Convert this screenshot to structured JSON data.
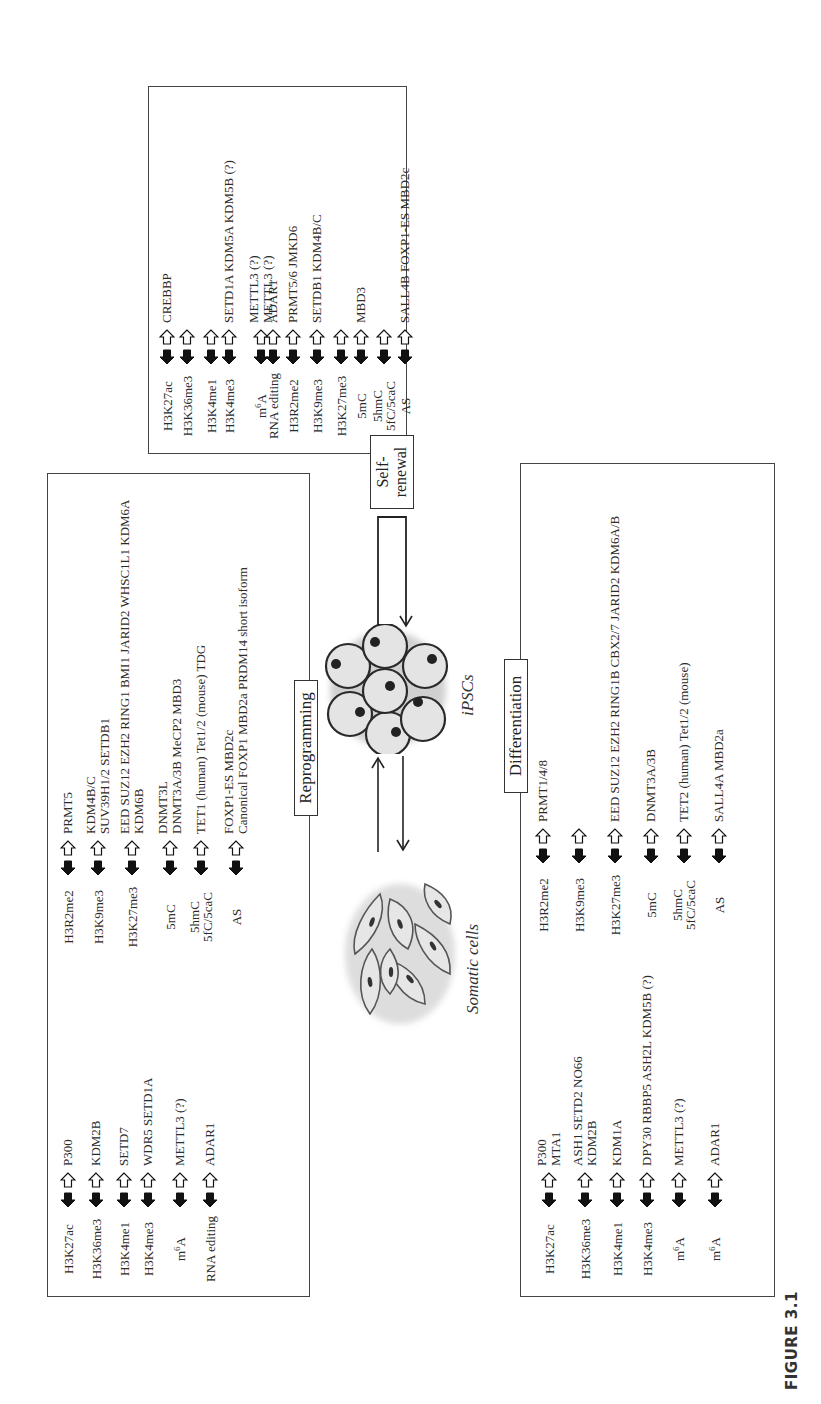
{
  "figure": {
    "label": "FIGURE 3.1",
    "orientation": "rotated 90 degrees counter-clockwise"
  },
  "cells": {
    "somatic_label": "Somatic cells",
    "ipsc_label": "iPSCs"
  },
  "panels": {
    "reprogramming": {
      "title": "Reprogramming",
      "rows": [
        {
          "mark": "H3K27ac",
          "genes": [
            "P300"
          ]
        },
        {
          "mark": "H3K36me3",
          "genes": [
            "KDM2B"
          ]
        },
        {
          "mark": "H3K4me1",
          "genes": [
            "SETD7"
          ]
        },
        {
          "mark": "H3K4me3",
          "genes": [
            "WDR5 SETD1A"
          ]
        },
        {
          "mark": "m6A",
          "genes": [
            "METTL3 (?)"
          ]
        },
        {
          "mark": "RNA editing",
          "genes": [
            "ADAR1"
          ]
        },
        {
          "mark": "H3R2me2",
          "genes": [
            "PRMT5"
          ]
        },
        {
          "mark": "H3K9me3",
          "genes": [
            "KDM4B/C",
            "SUV39H1/2 SETDB1"
          ]
        },
        {
          "mark": "H3K27me3",
          "genes": [
            "EED SUZ12 EZH2 RING1 BMI1 JARID2 WHSC1L1 KDM6A",
            "KDM6B"
          ]
        },
        {
          "mark": "5mC",
          "genes": [
            "DNMT3L",
            "DNMT3A/3B MeCP2 MBD3"
          ]
        },
        {
          "mark": "5hmC 5fC/5caC",
          "genes": [
            "TET1 (human) Tet1/2 (mouse) TDG"
          ]
        },
        {
          "mark": "AS",
          "genes": [
            "FOXP1-ES MBD2c",
            "Canonical FOXP1 MBD2a PRDM14 short isoform"
          ]
        }
      ]
    },
    "self_renewal": {
      "title": "Self-renewal",
      "rows": [
        {
          "mark": "H3K27ac",
          "genes": [
            "CREBBP"
          ]
        },
        {
          "mark": "H3K36me3",
          "genes": [
            ""
          ]
        },
        {
          "mark": "H3K4me1",
          "genes": [
            ""
          ]
        },
        {
          "mark": "H3K4me3",
          "genes": [
            "SETD1A KDM5A KDM5B (?)"
          ]
        },
        {
          "mark": "m6A",
          "genes": [
            "METTL3 (?)",
            "METTL3 (?)"
          ]
        },
        {
          "mark": "RNA editing",
          "genes": [
            "ADAR1"
          ]
        },
        {
          "mark": "H3R2me2",
          "genes": [
            "PRMT5/6 JMKD6"
          ]
        },
        {
          "mark": "H3K9me3",
          "genes": [
            "SETDB1 KDM4B/C"
          ]
        },
        {
          "mark": "H3K27me3",
          "genes": [
            ""
          ]
        },
        {
          "mark": "5mC",
          "genes": [
            "MBD3"
          ]
        },
        {
          "mark": "5hmC 5fC/5caC",
          "genes": [
            ""
          ]
        },
        {
          "mark": "AS",
          "genes": [
            "SALL4B FOXP1-ES MBD2c"
          ]
        }
      ]
    },
    "differentiation": {
      "title": "Differentiation",
      "rows": [
        {
          "mark": "H3K27ac",
          "genes": [
            "P300",
            "MTA1"
          ]
        },
        {
          "mark": "H3K36me3",
          "genes": [
            "ASH1 SETD2 NO66",
            "KDM2B"
          ]
        },
        {
          "mark": "H3K4me1",
          "genes": [
            "KDM1A"
          ]
        },
        {
          "mark": "H3K4me3",
          "genes": [
            "DPY30 RBBP5 ASH2L KDM5B (?)"
          ]
        },
        {
          "mark": "m6A",
          "genes": [
            "METTL3 (?)"
          ]
        },
        {
          "mark": "m6A",
          "genes": [
            "ADAR1"
          ]
        },
        {
          "mark": "H3R2me2",
          "genes": [
            "PRMT1/4/8"
          ]
        },
        {
          "mark": "H3K9me3",
          "genes": [
            ""
          ]
        },
        {
          "mark": "H3K27me3",
          "genes": [
            "EED SUZ12 EZH2 RING1B CBX2/7 JARID2 KDM6A/B"
          ]
        },
        {
          "mark": "5mC",
          "genes": [
            "DNMT3A/3B"
          ]
        },
        {
          "mark": "5hmC 5fC/5caC",
          "genes": [
            "TET2 (human) Tet1/2 (mouse)"
          ]
        },
        {
          "mark": "AS",
          "genes": [
            "SALL4A MBD2a"
          ]
        }
      ]
    }
  },
  "legend_arrows": {
    "filled_arrow": "black filled arrow (left)",
    "open_arrow": "white open arrow (right)"
  }
}
